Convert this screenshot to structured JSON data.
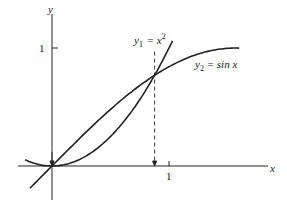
{
  "chart_data": {
    "type": "line",
    "title": "",
    "xlabel": "x",
    "ylabel": "y",
    "xlim": [
      -0.3,
      2.1
    ],
    "ylim": [
      -0.35,
      1.3
    ],
    "grid": false,
    "x_ticks": [
      "1"
    ],
    "y_ticks": [
      "1"
    ],
    "series": [
      {
        "name": "y1 = x^2",
        "label_main": "y",
        "label_sub": "1",
        "label_rest": " = x",
        "label_sup": "2",
        "x_range": [
          -0.23,
          1.03
        ],
        "function": "x^2"
      },
      {
        "name": "y2 = sin x",
        "label_main": "y",
        "label_sub": "2",
        "label_rest": " = sin x",
        "x_range": [
          -0.19,
          1.6
        ],
        "function": "sin(x)"
      }
    ],
    "annotations": [
      {
        "type": "arrow-down",
        "x": 0,
        "from_y": 0.12,
        "to_y": 0
      },
      {
        "type": "dashed-arrow-down",
        "x": 0.877,
        "from_y": 0.97,
        "to_y": 0,
        "note": "intersection at x≈0.877"
      }
    ]
  }
}
